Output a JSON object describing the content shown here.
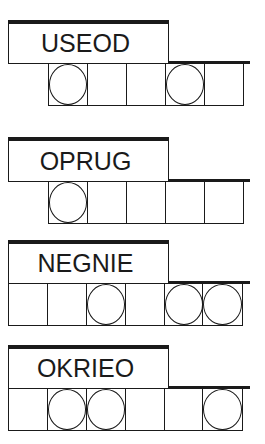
{
  "puzzles": [
    {
      "scrambled": "USEOD",
      "cells": [
        true,
        false,
        false,
        true,
        false
      ]
    },
    {
      "scrambled": "OPRUG",
      "cells": [
        true,
        false,
        false,
        false,
        false
      ]
    },
    {
      "scrambled": "NEGNIE",
      "cells": [
        false,
        false,
        true,
        false,
        true,
        true
      ]
    },
    {
      "scrambled": "OKRIEO",
      "cells": [
        false,
        true,
        true,
        false,
        false,
        true
      ]
    }
  ]
}
